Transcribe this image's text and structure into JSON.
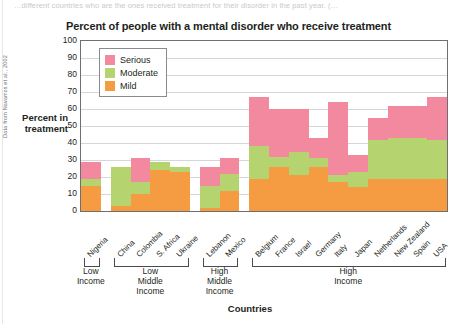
{
  "top_fragment": "…different countries who are the ones received treatment for their disorder in the past year. (…",
  "source_credit": "Data from Navarros et al., 2002",
  "chart_data": {
    "type": "bar",
    "title": "Percent of people with a mental disorder who receive treatment",
    "xlabel": "Countries",
    "ylabel": "Percent in treatment",
    "ylim": [
      0,
      100
    ],
    "yticks": [
      100,
      90,
      80,
      70,
      60,
      50,
      40,
      30,
      20,
      10,
      0
    ],
    "grid": true,
    "stacked": true,
    "legend_position": "top-left",
    "legend": [
      "Serious",
      "Moderate",
      "Mild"
    ],
    "colors": {
      "serious": "#f2899f",
      "moderate": "#b5d470",
      "mild": "#f59b42"
    },
    "categories": [
      "Nigeria",
      "China",
      "Colombia",
      "S. Africa",
      "Ukraine",
      "Lebanon",
      "Mexico",
      "Belgium",
      "France",
      "Israel",
      "Germany",
      "Italy",
      "Japan",
      "Netherlands",
      "New Zealand",
      "Spain",
      "USA"
    ],
    "series": [
      {
        "name": "Mild",
        "values": [
          15,
          3,
          10,
          24,
          23,
          2,
          12,
          19,
          26,
          21,
          26,
          17,
          14,
          19,
          19,
          19,
          19
        ]
      },
      {
        "name": "Moderate",
        "values": [
          4,
          23,
          7,
          5,
          3,
          13,
          10,
          19,
          6,
          14,
          5,
          4,
          9,
          23,
          24,
          24,
          23
        ]
      },
      {
        "name": "Serious",
        "values": [
          10,
          0,
          14,
          0,
          0,
          11,
          9,
          29,
          28,
          25,
          12,
          43,
          10,
          13,
          19,
          19,
          25
        ]
      }
    ],
    "totals": [
      29,
      26,
      31,
      29,
      26,
      26,
      31,
      67,
      60,
      60,
      43,
      64,
      33,
      55,
      62,
      62,
      67
    ],
    "groups": [
      {
        "label": "Low\nIncome",
        "countries": [
          "Nigeria"
        ]
      },
      {
        "label": "Low\nMiddle\nIncome",
        "countries": [
          "China",
          "Colombia",
          "S. Africa",
          "Ukraine"
        ]
      },
      {
        "label": "High\nMiddle\nIncome",
        "countries": [
          "Lebanon",
          "Mexico"
        ]
      },
      {
        "label": "High\nIncome",
        "countries": [
          "Belgium",
          "France",
          "Israel",
          "Germany",
          "Italy",
          "Japan",
          "Netherlands",
          "New Zealand",
          "Spain",
          "USA"
        ]
      }
    ],
    "group_labels": [
      "Low Income",
      "Low Middle Income",
      "High Middle Income",
      "High Income"
    ]
  }
}
